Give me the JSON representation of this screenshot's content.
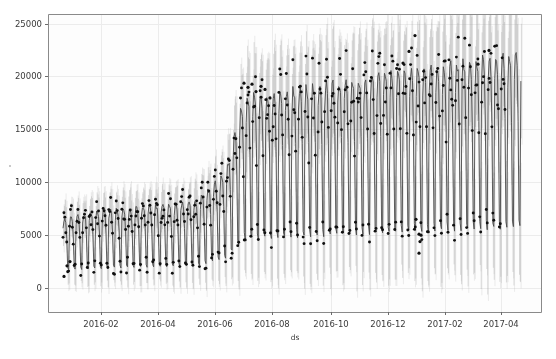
{
  "chart_data": {
    "type": "scatter",
    "title": "",
    "subtitle": "",
    "xlabel": "ds",
    "ylabel": "",
    "xlim": [
      "2016-01-01",
      "2017-05-20"
    ],
    "ylim": [
      -2500,
      25800
    ],
    "grid": true,
    "legend_position": "none",
    "x_ticks": [
      "2016-02",
      "2016-04",
      "2016-06",
      "2016-08",
      "2016-10",
      "2016-12",
      "2017-02",
      "2017-04"
    ],
    "x_tick_positions": [
      101,
      158,
      215,
      272,
      331,
      388,
      445,
      501
    ],
    "y_ticks": [
      0,
      5000,
      10000,
      15000,
      20000,
      25000
    ],
    "y_tick_positions": [
      288,
      235,
      182,
      129,
      76,
      24
    ],
    "series": [
      {
        "name": "yhat",
        "color": "#4a4a4a",
        "style": "line",
        "description": "forecast mean with weekly oscillation between weekday peak and weekend trough"
      },
      {
        "name": "uncertainty_interval",
        "color": "#b8b8b8",
        "style": "band",
        "description": "yhat_lower to yhat_upper shaded region"
      },
      {
        "name": "observed",
        "color": "#111111",
        "style": "points",
        "description": "actual y observations plotted as small black dots"
      }
    ],
    "trend_segments": [
      {
        "date": "2016-01-06",
        "level": 4200
      },
      {
        "date": "2016-02-01",
        "level": 4700
      },
      {
        "date": "2016-03-01",
        "level": 5000
      },
      {
        "date": "2016-04-01",
        "level": 5200
      },
      {
        "date": "2016-05-01",
        "level": 5400
      },
      {
        "date": "2016-06-01",
        "level": 5600
      },
      {
        "date": "2016-07-01",
        "level": 7500
      },
      {
        "date": "2016-07-20",
        "level": 12400
      },
      {
        "date": "2016-08-15",
        "level": 12600
      },
      {
        "date": "2016-09-15",
        "level": 12900
      },
      {
        "date": "2016-10-15",
        "level": 13200
      },
      {
        "date": "2016-11-15",
        "level": 13600
      },
      {
        "date": "2016-12-15",
        "level": 13900
      },
      {
        "date": "2017-01-15",
        "level": 14200
      },
      {
        "date": "2017-02-15",
        "level": 14500
      },
      {
        "date": "2017-03-15",
        "level": 14800
      },
      {
        "date": "2017-05-10",
        "level": 15200
      }
    ],
    "weekly_seasonality": {
      "peak_factor": 1.45,
      "trough_factor": 0.42,
      "peak_days": [
        "Tue",
        "Wed",
        "Thu"
      ],
      "trough_days": [
        "Sat",
        "Sun"
      ]
    },
    "uncertainty_half_width_fraction": 0.32,
    "outliers_high": [
      {
        "x": 244,
        "value": 19400
      },
      {
        "x": 248,
        "value": 19000
      },
      {
        "x": 252,
        "value": 19300
      },
      {
        "x": 256,
        "value": 18600
      },
      {
        "x": 261,
        "value": 19100
      },
      {
        "x": 265,
        "value": 18800
      },
      {
        "x": 270,
        "value": 18000
      },
      {
        "x": 415,
        "value": 23900
      },
      {
        "x": 409,
        "value": 22400
      },
      {
        "x": 403,
        "value": 21300
      },
      {
        "x": 489,
        "value": 22500
      },
      {
        "x": 478,
        "value": 21200
      }
    ],
    "outliers_low": [
      {
        "x": 64,
        "value": 1100
      },
      {
        "x": 67,
        "value": 2100
      },
      {
        "x": 70,
        "value": 2500
      },
      {
        "x": 416,
        "value": 6500
      },
      {
        "x": 419,
        "value": 5100
      },
      {
        "x": 421,
        "value": 5000
      },
      {
        "x": 420,
        "value": 4400
      },
      {
        "x": 419,
        "value": 3300
      }
    ],
    "observed_end_x": 505,
    "forecast_end_x": 521,
    "data_start_x": 63,
    "axes_rect": {
      "left": 48,
      "top": 14,
      "right": 541,
      "bottom": 312
    }
  },
  "axis": {
    "x_title": "ds",
    "x_tick_labels": [
      "2016-02",
      "2016-04",
      "2016-06",
      "2016-08",
      "2016-10",
      "2016-12",
      "2017-02",
      "2017-04"
    ],
    "y_tick_labels": [
      "25000",
      "20000",
      "15000",
      "10000",
      "5000",
      "0"
    ]
  },
  "colors": {
    "background": "#ffffff",
    "plot_background": "#fdfdfd",
    "axis_border": "#8a8a8a",
    "grid": "#ececec",
    "forecast_line": "#4a4a4a",
    "uncertainty_band": "#bdbdbd",
    "observed_points": "#101010",
    "tick_text": "#3a3a3a"
  }
}
